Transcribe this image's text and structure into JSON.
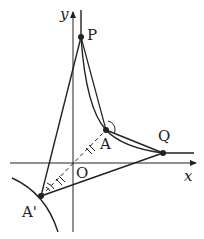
{
  "diagram": {
    "type": "geometry",
    "axes": {
      "x_label": "x",
      "y_label": "y",
      "origin_label": "O"
    },
    "points": [
      {
        "id": "P",
        "label": "P",
        "x": 81,
        "y": 37
      },
      {
        "id": "A",
        "label": "A",
        "x": 106,
        "y": 130
      },
      {
        "id": "Q",
        "label": "Q",
        "x": 163,
        "y": 153
      },
      {
        "id": "A_prime",
        "label": "A'",
        "x": 41,
        "y": 196
      }
    ],
    "segments": [
      "PA'",
      "PQ",
      "A'Q",
      "AQ",
      "A'A (dashed, through O)"
    ],
    "notes": [
      "Equal-length tick marks on OA and OA'",
      "Angle arcs at A and A'",
      "Curves: hyperbola branches"
    ],
    "colors": {
      "stroke": "#222222",
      "background": "#ffffff"
    }
  }
}
